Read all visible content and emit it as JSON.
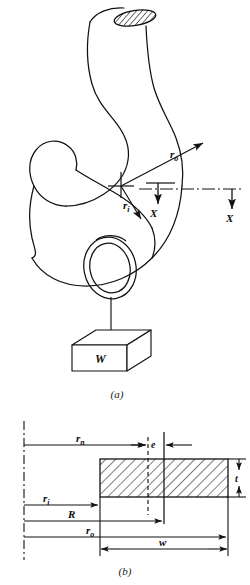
{
  "figure": {
    "background_color": "#ffffff",
    "line_color": "#121212",
    "subfigures": [
      {
        "caption": "(a)",
        "name": "crane-hook-pictorial",
        "labels": [
          {
            "id": "r_o",
            "base": "r",
            "sub": "o",
            "meaning": "outer-radius"
          },
          {
            "id": "r_i",
            "base": "r",
            "sub": "i",
            "meaning": "inner-radius"
          },
          {
            "id": "X_left",
            "base": "X",
            "sub": "",
            "meaning": "section-marker-left"
          },
          {
            "id": "X_right",
            "base": "X",
            "sub": "",
            "meaning": "section-marker-right"
          },
          {
            "id": "W",
            "base": "W",
            "sub": "",
            "meaning": "suspended-load-weight"
          }
        ]
      },
      {
        "caption": "(b)",
        "name": "rectangular-cross-section",
        "labels": [
          {
            "id": "r_n",
            "base": "r",
            "sub": "n",
            "meaning": "neutral-axis-radius"
          },
          {
            "id": "e",
            "base": "e",
            "sub": "",
            "meaning": "eccentricity"
          },
          {
            "id": "r_i",
            "base": "r",
            "sub": "i",
            "meaning": "inner-radius"
          },
          {
            "id": "R",
            "base": "R",
            "sub": "",
            "meaning": "centroidal-radius"
          },
          {
            "id": "r_o",
            "base": "r",
            "sub": "o",
            "meaning": "outer-radius"
          },
          {
            "id": "w",
            "base": "w",
            "sub": "",
            "meaning": "section-width"
          },
          {
            "id": "t",
            "base": "t",
            "sub": "",
            "meaning": "section-thickness"
          }
        ]
      }
    ]
  },
  "labels_a": {
    "r_o_base": "r",
    "r_o_sub": "o",
    "r_i_base": "r",
    "r_i_sub": "i",
    "x_left": "X",
    "x_right": "X",
    "weight": "W",
    "caption": "(a)"
  },
  "labels_b": {
    "r_n_base": "r",
    "r_n_sub": "n",
    "e": "e",
    "r_i_base": "r",
    "r_i_sub": "i",
    "R": "R",
    "r_o_base": "r",
    "r_o_sub": "o",
    "w": "w",
    "t": "t",
    "caption": "(b)"
  }
}
